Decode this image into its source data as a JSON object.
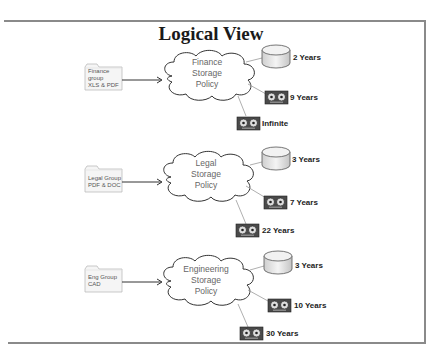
{
  "title": "Logical View",
  "groups": [
    {
      "folder": "Finance\ngroup\nXLS & PDF",
      "policy": "Finance\nStorage\nPolicy",
      "disk": "2 Years",
      "tape1": "9 Years",
      "tape2": "Infinite"
    },
    {
      "folder": "Legal Group\nPDF & DOC",
      "policy": "Legal\nStorage\nPolicy",
      "disk": "3 Years",
      "tape1": "7 Years",
      "tape2": "22 Years"
    },
    {
      "folder": "Eng Group\nCAD",
      "policy": "Engineering\nStorage\nPolicy",
      "disk": "3 Years",
      "tape1": "10 Years",
      "tape2": "30 Years"
    }
  ],
  "icons": {
    "folder": "folder-icon",
    "cloud": "cloud-icon",
    "disk": "disk-cylinder-icon",
    "tape": "tape-drive-icon"
  },
  "colors": {
    "frame": "#8a8a8a",
    "tape_body": "#4a4a4a",
    "connector": "#9a9a9a"
  }
}
